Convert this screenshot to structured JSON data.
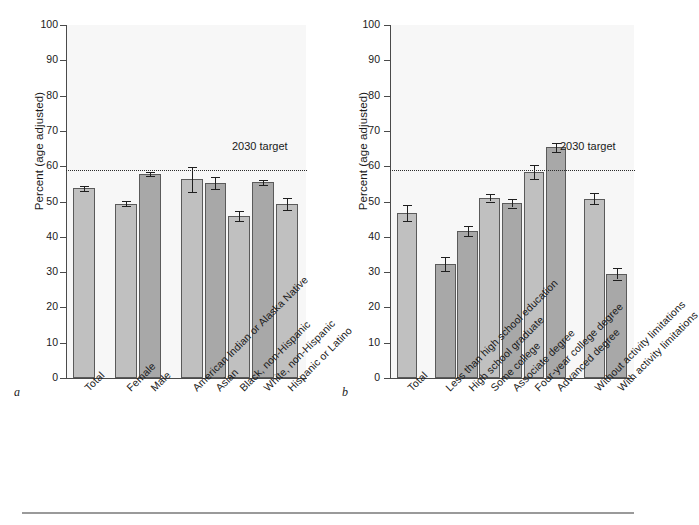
{
  "figure": {
    "axis_title": "Percent (age adjusted)",
    "target_label": "2030 target",
    "panel_a_letter": "a",
    "panel_b_letter": "b",
    "y_ticks": [
      "0",
      "10",
      "20",
      "30",
      "40",
      "50",
      "60",
      "70",
      "80",
      "90",
      "100"
    ],
    "target_value": 59
  },
  "chart_data": [
    {
      "type": "bar",
      "panel": "a",
      "title": "",
      "xlabel": "",
      "ylabel": "Percent (age adjusted)",
      "ylim": [
        0,
        100
      ],
      "yticks": [
        0,
        10,
        20,
        30,
        40,
        50,
        60,
        70,
        80,
        90,
        100
      ],
      "grid": false,
      "legend": "none",
      "annotations": [
        {
          "text": "2030 target",
          "value": 59,
          "style": "dotted-horizontal-line"
        }
      ],
      "categories": [
        "Total",
        "Female",
        "Male",
        "American Indian or Alaska Native",
        "Asian",
        "Black, non-Hispanic",
        "White, non-Hispanic",
        "Hispanic or Latino"
      ],
      "values": [
        53.7,
        49.4,
        57.8,
        56.3,
        55.1,
        45.9,
        55.4,
        49.3
      ],
      "errors_low": [
        53.0,
        48.7,
        57.2,
        52.6,
        53.4,
        44.5,
        54.6,
        47.6
      ],
      "errors_high": [
        54.4,
        50.1,
        58.4,
        59.8,
        56.8,
        47.3,
        56.2,
        51.0
      ],
      "group_gaps_after": [
        0,
        2
      ],
      "shading": [
        "light",
        "light",
        "dark",
        "light",
        "dark",
        "light",
        "dark",
        "light"
      ]
    },
    {
      "type": "bar",
      "panel": "b",
      "title": "",
      "xlabel": "",
      "ylabel": "Percent (age adjusted)",
      "ylim": [
        0,
        100
      ],
      "yticks": [
        0,
        10,
        20,
        30,
        40,
        50,
        60,
        70,
        80,
        90,
        100
      ],
      "grid": false,
      "legend": "none",
      "annotations": [
        {
          "text": "2030 target",
          "value": 59,
          "style": "dotted-horizontal-line"
        }
      ],
      "categories": [
        "Total",
        "Less than high school education",
        "High school graduate",
        "Some college",
        "Associate degree",
        "Four-year college degree",
        "Advanced degree",
        "Without activity limitations",
        "With activity limitations"
      ],
      "values": [
        46.8,
        32.3,
        41.7,
        51.1,
        49.5,
        58.3,
        65.3,
        50.8,
        29.5
      ],
      "errors_low": [
        44.6,
        30.4,
        40.2,
        50.0,
        48.3,
        56.4,
        64.0,
        49.2,
        27.9
      ],
      "errors_high": [
        49.0,
        34.2,
        43.2,
        52.2,
        50.7,
        60.2,
        66.6,
        52.4,
        31.1
      ],
      "group_gaps_after": [
        0,
        6
      ],
      "shading": [
        "light",
        "dark",
        "dark",
        "light",
        "dark",
        "light",
        "dark",
        "light",
        "dark"
      ]
    }
  ],
  "colors": {
    "bar_light": "#c0c0c0",
    "bar_dark": "#a8a8a8",
    "bar_edge": "#5a5a5a",
    "axis": "#4a4a4a",
    "plot_background": "#f7f7f7",
    "text": "#1a1a1a"
  }
}
